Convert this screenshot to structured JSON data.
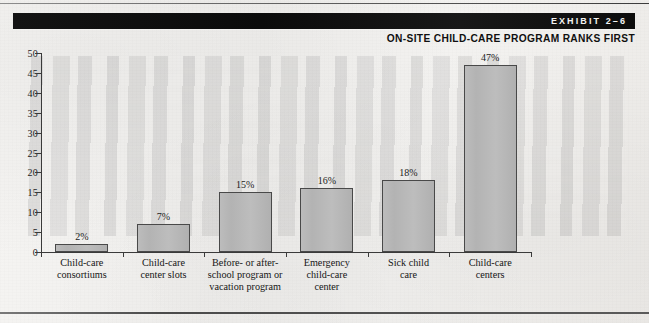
{
  "header": {
    "exhibit_label": "EXHIBIT 2–6",
    "subtitle": "ON-SITE CHILD-CARE PROGRAM RANKS FIRST"
  },
  "chart_data": {
    "type": "bar",
    "title": "ON-SITE CHILD-CARE PROGRAM RANKS FIRST",
    "exhibit": "EXHIBIT 2–6",
    "xlabel": "",
    "ylabel": "",
    "ylim": [
      0,
      50
    ],
    "ytick_step": 5,
    "yticks": [
      "0",
      "5",
      "10",
      "15",
      "20",
      "25",
      "30",
      "35",
      "40",
      "45",
      "50"
    ],
    "grid": false,
    "legend": false,
    "bar_fill_color": "#b5b5b5",
    "bar_edge_color": "#494949",
    "categories": [
      "Child-care\nconsortiums",
      "Child-care\ncenter slots",
      "Before- or after-\nschool program or\nvacation program",
      "Emergency\nchild-care\ncenter",
      "Sick child\ncare",
      "Child-care\ncenters"
    ],
    "values": [
      2,
      7,
      15,
      16,
      18,
      47
    ],
    "value_labels": [
      "2%",
      "7%",
      "15%",
      "16%",
      "18%",
      "47%"
    ]
  }
}
